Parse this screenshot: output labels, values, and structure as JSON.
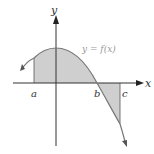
{
  "diagram": {
    "type": "area-under-curve",
    "curve_label": "y = f(x)",
    "axes": {
      "x_label": "x",
      "y_label": "y"
    },
    "points": {
      "a": "a",
      "b": "b",
      "c": "c"
    },
    "colors": {
      "axis": "#333333",
      "curve": "#777777",
      "shade": "#cfcfcf",
      "label_curve": "#999999",
      "text": "#333333"
    },
    "regions": [
      {
        "from": "a",
        "to": "b",
        "side": "above x-axis"
      },
      {
        "from": "b",
        "to": "c",
        "side": "below x-axis"
      }
    ]
  }
}
